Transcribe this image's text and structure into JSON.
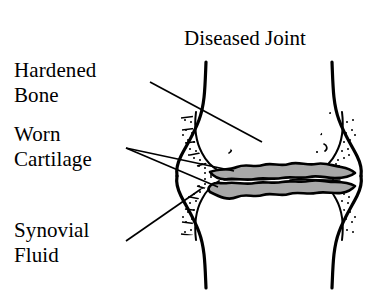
{
  "figure": {
    "title": "Diseased Joint",
    "labels": [
      {
        "id": "hardened-bone",
        "text": "Hardened\nBone"
      },
      {
        "id": "worn-cartilage",
        "text": "Worn\nCartilage"
      },
      {
        "id": "synovial-fluid",
        "text": "Synovial\nFluid"
      }
    ],
    "colors": {
      "background": "#ffffff",
      "ink": "#000000",
      "cartilage_fill": "#a8a8a8",
      "bone_fill": "#ffffff"
    },
    "parts": {
      "upper_bone": "upper-bone",
      "lower_bone": "lower-bone",
      "cortical_band_left": "left-cortex-stipple",
      "cortical_band_right": "right-cortex-stipple",
      "cartilage_band": "worn-cartilage-band",
      "trabecular_upper": "upper-trabecular-speckle",
      "trabecular_lower": "lower-trabecular-speckle"
    },
    "leader_lines": [
      {
        "id": "leader-hardened-bone",
        "from": [
          150,
          82
        ],
        "to": [
          262,
          142
        ]
      },
      {
        "id": "leader-worn-cartilage-upper",
        "from": [
          126,
          148
        ],
        "to": [
          232,
          172
        ]
      },
      {
        "id": "leader-worn-cartilage-lower",
        "from": [
          126,
          148
        ],
        "to": [
          216,
          186
        ]
      },
      {
        "id": "leader-synovial-fluid",
        "from": [
          126,
          240
        ],
        "to": [
          200,
          190
        ]
      }
    ]
  }
}
